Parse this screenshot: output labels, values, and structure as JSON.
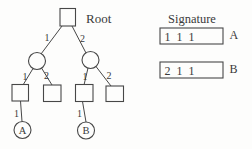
{
  "colors": {
    "ink": "#474747",
    "text": "#3a3a3a",
    "background": "#fdfdfc"
  },
  "tree": {
    "root_label": "Root",
    "edges": {
      "root_to_left": "1",
      "root_to_right": "2",
      "left_to_child1": "1",
      "left_to_child2": "2",
      "right_to_child1": "1",
      "right_to_child2": "2",
      "square1_to_a": "1",
      "square3_to_b": "1"
    },
    "leaves": {
      "a": "A",
      "b": "B"
    }
  },
  "signature": {
    "title": "Signature",
    "entries": [
      {
        "value": "1 1 1",
        "label": "A"
      },
      {
        "value": "2 1 1",
        "label": "B"
      }
    ]
  }
}
